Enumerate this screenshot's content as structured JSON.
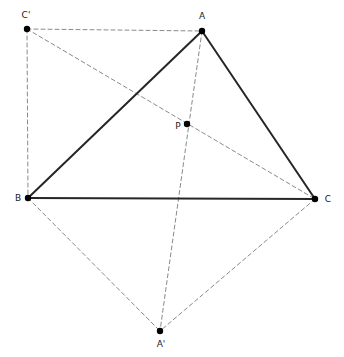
{
  "figure": {
    "canvas": {
      "width": 344,
      "height": 357,
      "background": "#ffffff"
    },
    "style": {
      "solid_color": "#262626",
      "dashed_color": "#8a8a8a",
      "point_color": "#000000",
      "label_color": "#1a1a1a",
      "solid_width": 2.0,
      "dashed_width": 1.0,
      "dash_pattern": "4,3",
      "point_radius": 3.2,
      "label_font_size": 9
    },
    "points": [
      {
        "id": "A",
        "label": "A",
        "x": 202,
        "y": 31,
        "label_x": 202,
        "label_y": 19,
        "label_anchor": "middle"
      },
      {
        "id": "B",
        "label": "B",
        "x": 28,
        "y": 198,
        "label_x": 18,
        "label_y": 201,
        "label_anchor": "middle"
      },
      {
        "id": "C",
        "label": "C",
        "x": 315,
        "y": 199,
        "label_x": 328,
        "label_y": 202,
        "label_anchor": "middle"
      },
      {
        "id": "P",
        "label": "P",
        "x": 187,
        "y": 124,
        "label_x": 178,
        "label_y": 129,
        "label_anchor": "middle"
      },
      {
        "id": "Aprime",
        "label": "A'",
        "x": 160,
        "y": 331,
        "label_x": 161,
        "label_y": 347,
        "label_anchor": "middle"
      },
      {
        "id": "Cprime",
        "label": "C'",
        "x": 27,
        "y": 29,
        "label_x": 26,
        "label_y": 18,
        "label_anchor": "middle"
      }
    ],
    "solid_segments": [
      {
        "id": "AB",
        "from": "A",
        "to": "B",
        "x1": 202,
        "y1": 31,
        "x2": 28,
        "y2": 198
      },
      {
        "id": "AC",
        "from": "A",
        "to": "C",
        "x1": 202,
        "y1": 31,
        "x2": 315,
        "y2": 199
      },
      {
        "id": "BC",
        "from": "B",
        "to": "C",
        "x1": 28,
        "y1": 198,
        "x2": 315,
        "y2": 199
      }
    ],
    "dashed_segments": [
      {
        "id": "CprimeA",
        "from": "C'",
        "to": "A",
        "x1": 27,
        "y1": 29,
        "x2": 202,
        "y2": 31
      },
      {
        "id": "CprimeB",
        "from": "C'",
        "to": "B",
        "x1": 27,
        "y1": 29,
        "x2": 28,
        "y2": 198
      },
      {
        "id": "CprimeC",
        "from": "C'",
        "to": "C",
        "x1": 27,
        "y1": 29,
        "x2": 315,
        "y2": 199
      },
      {
        "id": "AAprime",
        "from": "A",
        "to": "A'",
        "x1": 202,
        "y1": 31,
        "x2": 160,
        "y2": 331
      },
      {
        "id": "BAprime",
        "from": "B",
        "to": "A'",
        "x1": 28,
        "y1": 198,
        "x2": 160,
        "y2": 331
      },
      {
        "id": "CAprime",
        "from": "C",
        "to": "A'",
        "x1": 315,
        "y1": 199,
        "x2": 160,
        "y2": 331
      }
    ]
  }
}
